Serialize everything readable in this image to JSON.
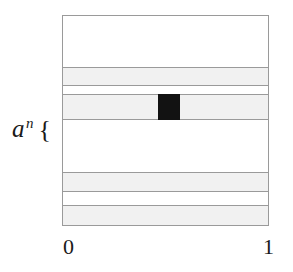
{
  "figure": {
    "title": "",
    "background_color": "#ffffff",
    "box": {
      "left": 62,
      "top": 15,
      "width": 207,
      "height": 211,
      "border_color": "#9a9a9a"
    },
    "band_color": "#f1f1f1",
    "line_color": "#9a9a9a",
    "fill_color": "#121212"
  },
  "labels": {
    "row_label": {
      "base": "a",
      "exponent": "n",
      "brace": "{",
      "full_text": "a^n {"
    }
  },
  "axis": {
    "ticks": [
      {
        "label": "0",
        "value": 0,
        "position": "left"
      },
      {
        "label": "1",
        "value": 1,
        "position": "right"
      }
    ]
  },
  "chart_data": {
    "type": "heatmap",
    "title": "",
    "xlabel": "",
    "ylabel": "",
    "xlim": [
      0,
      1
    ],
    "ylim": [
      0,
      1
    ],
    "grid": false,
    "legend": null,
    "xticks": [
      0,
      1
    ],
    "xticklabels": [
      "0",
      "1"
    ],
    "yticks": [],
    "yticklabels": [],
    "bands": [
      {
        "index": 1,
        "y_top": 67,
        "y_bottom": 86,
        "shaded": true,
        "fill": "#f1f1f1"
      },
      {
        "index": 2,
        "y_top": 94,
        "y_bottom": 120,
        "shaded": true,
        "fill": "#f1f1f1",
        "label": "a^n {"
      },
      {
        "index": 3,
        "y_top": 172,
        "y_bottom": 192,
        "shaded": true,
        "fill": "#f1f1f1"
      },
      {
        "index": 4,
        "y_top": 205,
        "y_bottom": 226,
        "shaded": true,
        "fill": "#f1f1f1"
      }
    ],
    "cells": [
      {
        "band_index": 2,
        "x_start": 0.464,
        "x_end": 0.57,
        "px_left": 158,
        "px_right": 180,
        "px_top": 94,
        "px_bottom": 120,
        "fill": "#121212"
      }
    ]
  }
}
